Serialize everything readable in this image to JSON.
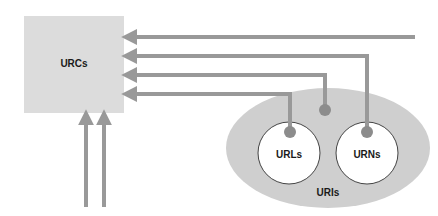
{
  "diagram": {
    "type": "relationship-diagram",
    "nodes": {
      "urcs": {
        "label": "URCs"
      },
      "uris": {
        "label": "URIs"
      },
      "urls": {
        "label": "URLs"
      },
      "urns": {
        "label": "URNs"
      }
    },
    "edges": [
      {
        "from": "external",
        "to": "urcs",
        "direction": "left"
      },
      {
        "from": "urns",
        "to": "urcs",
        "direction": "left"
      },
      {
        "from": "uris",
        "to": "urcs",
        "direction": "left"
      },
      {
        "from": "urls",
        "to": "urcs",
        "direction": "left"
      },
      {
        "from": "external",
        "to": "urcs",
        "direction": "up"
      },
      {
        "from": "external",
        "to": "urcs",
        "direction": "up"
      }
    ],
    "colors": {
      "box_fill": "#dcdcdc",
      "ellipse_fill": "#cfcfcf",
      "arrow": "#999999",
      "dot": "#8c8c8c",
      "circle_fill": "#ffffff",
      "circle_stroke": "#444444"
    }
  }
}
